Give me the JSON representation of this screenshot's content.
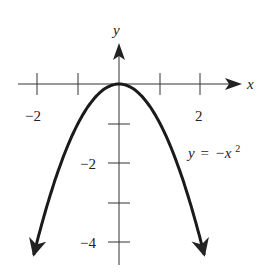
{
  "chart_data": {
    "type": "line",
    "title": "",
    "equation_label": "y = −x²",
    "equation_parts": {
      "lhs": "y",
      "eq": "=",
      "rhs": "−x",
      "exp": "2"
    },
    "xlabel": "x",
    "ylabel": "y",
    "xlim": [
      -2.2,
      2.9
    ],
    "ylim": [
      -4.6,
      1.0
    ],
    "x_ticks": [
      -2,
      -1,
      1,
      2
    ],
    "x_tick_labels": [
      {
        "value": -2,
        "text": "−2"
      },
      {
        "value": 2,
        "text": "2"
      }
    ],
    "y_ticks": [
      -1,
      -2,
      -3,
      -4
    ],
    "y_tick_labels": [
      {
        "value": -2,
        "text": "−2"
      },
      {
        "value": -4,
        "text": "−4"
      }
    ],
    "grid": false,
    "legend": null,
    "series": [
      {
        "name": "y = −x²",
        "function": "-x^2",
        "x": [
          -2.1,
          -2,
          -1.5,
          -1,
          -0.5,
          0,
          0.5,
          1,
          1.5,
          2,
          2.1
        ],
        "y": [
          -4.41,
          -4,
          -2.25,
          -1,
          -0.25,
          0,
          -0.25,
          -1,
          -2.25,
          -4,
          -4.41
        ],
        "arrows_at_ends": true
      }
    ]
  },
  "colors": {
    "ink": "#222222",
    "background": "#ffffff"
  }
}
